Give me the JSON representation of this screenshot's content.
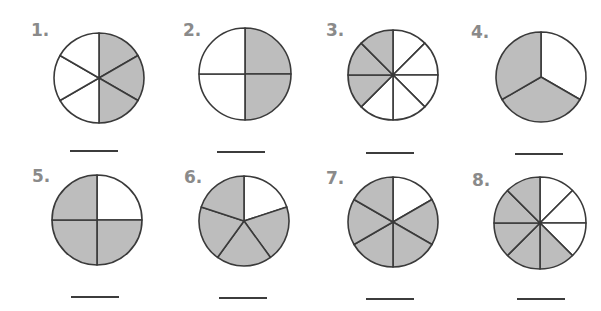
{
  "worksheet": {
    "shade_color": "#bdbdbd",
    "stroke_color": "#3a3a3a",
    "label_color": "#8a8a8a",
    "problems": [
      {
        "label": "1.",
        "parts": 6,
        "shaded": [
          0,
          1,
          2
        ],
        "start_angle": -90,
        "cx": 99,
        "cy": 78,
        "r": 45,
        "lx": 31,
        "ly": 20,
        "line_x": 70,
        "line_y": 150
      },
      {
        "label": "2.",
        "parts": 4,
        "shaded": [
          0,
          1
        ],
        "start_angle": -90,
        "cx": 245,
        "cy": 74,
        "r": 46,
        "lx": 183,
        "ly": 20,
        "line_x": 217,
        "line_y": 151
      },
      {
        "label": "3.",
        "parts": 8,
        "shaded": [
          5,
          6,
          7
        ],
        "start_angle": -90,
        "cx": 393,
        "cy": 75,
        "r": 45,
        "lx": 326,
        "ly": 20,
        "line_x": 366,
        "line_y": 152
      },
      {
        "label": "4.",
        "parts": 3,
        "shaded": [
          1,
          2
        ],
        "start_angle": -90,
        "cx": 541,
        "cy": 77,
        "r": 45,
        "lx": 471,
        "ly": 22,
        "line_x": 515,
        "line_y": 153
      },
      {
        "label": "5.",
        "parts": 4,
        "shaded": [
          1,
          2,
          3
        ],
        "start_angle": -90,
        "cx": 97,
        "cy": 220,
        "r": 45,
        "lx": 32,
        "ly": 166,
        "line_x": 71,
        "line_y": 296
      },
      {
        "label": "6.",
        "parts": 5,
        "shaded": [
          1,
          2,
          3,
          4
        ],
        "start_angle": -90,
        "cx": 244,
        "cy": 221,
        "r": 45,
        "lx": 184,
        "ly": 167,
        "line_x": 219,
        "line_y": 297
      },
      {
        "label": "7.",
        "parts": 6,
        "shaded": [
          1,
          2,
          3,
          4,
          5
        ],
        "start_angle": -90,
        "cx": 393,
        "cy": 222,
        "r": 45,
        "lx": 326,
        "ly": 168,
        "line_x": 366,
        "line_y": 298
      },
      {
        "label": "8.",
        "parts": 8,
        "shaded": [
          3,
          4,
          5,
          6,
          7
        ],
        "start_angle": -90,
        "cx": 540,
        "cy": 223,
        "r": 46,
        "lx": 472,
        "ly": 170,
        "line_x": 517,
        "line_y": 298
      }
    ]
  },
  "chart_data": {
    "type": "pie",
    "title": "",
    "items": [
      {
        "number": 1,
        "total_parts": 6,
        "shaded_parts": 3,
        "fraction": "3/6"
      },
      {
        "number": 2,
        "total_parts": 4,
        "shaded_parts": 2,
        "fraction": "2/4"
      },
      {
        "number": 3,
        "total_parts": 8,
        "shaded_parts": 3,
        "fraction": "3/8"
      },
      {
        "number": 4,
        "total_parts": 3,
        "shaded_parts": 2,
        "fraction": "2/3"
      },
      {
        "number": 5,
        "total_parts": 4,
        "shaded_parts": 3,
        "fraction": "3/4"
      },
      {
        "number": 6,
        "total_parts": 5,
        "shaded_parts": 4,
        "fraction": "4/5"
      },
      {
        "number": 7,
        "total_parts": 6,
        "shaded_parts": 5,
        "fraction": "5/6"
      },
      {
        "number": 8,
        "total_parts": 8,
        "shaded_parts": 5,
        "fraction": "5/8"
      }
    ]
  }
}
